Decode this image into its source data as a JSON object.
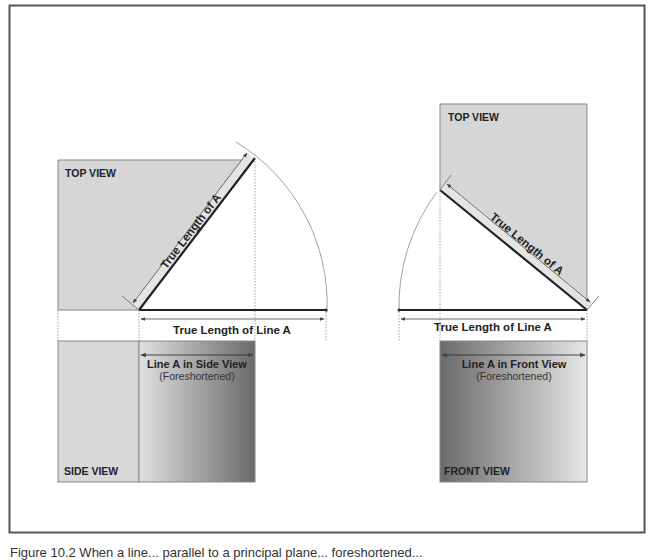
{
  "figure": {
    "left": {
      "top_view_label": "TOP VIEW",
      "side_view_label": "SIDE VIEW",
      "diagonal_label": "True Length of A",
      "dimension_label": "True Length of Line A",
      "projection_label": "Line A in Side View",
      "projection_note": "(Foreshortened)"
    },
    "right": {
      "top_view_label": "TOP VIEW",
      "front_view_label": "FRONT VIEW",
      "diagonal_label": "True Length of A",
      "dimension_label": "True Length of Line A",
      "projection_label": "Line A in Front View",
      "projection_note": "(Foreshortened)"
    },
    "colors": {
      "view_fill": "#d6d6d6",
      "gradient_dark": "#6e6e6e",
      "gradient_light": "#dedede",
      "line": "#333333",
      "frame": "#555555"
    }
  },
  "caption": "Figure 10.2 When a line... parallel to a principal plane... foreshortened..."
}
